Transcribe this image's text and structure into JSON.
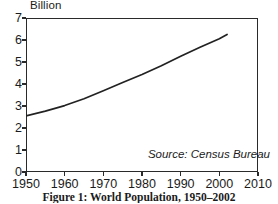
{
  "figure": {
    "caption": "Figure 1: World Population, 1950–2002",
    "source_note": "Source: Census Bureau",
    "unit_label": "Billion"
  },
  "chart_data": {
    "type": "line",
    "title": "World Population, 1950–2002",
    "xlabel": "",
    "ylabel": "Billion",
    "xlim": [
      1950,
      2010
    ],
    "ylim": [
      0,
      7
    ],
    "grid": false,
    "legend": "none",
    "line_color": "#222222",
    "xticks": [
      1950,
      1960,
      1970,
      1980,
      1990,
      2000,
      2010
    ],
    "xtick_labels": [
      "1950",
      "1960",
      "1970",
      "1980",
      "1990",
      "2000",
      "2010"
    ],
    "yticks": [
      0,
      1,
      2,
      3,
      4,
      5,
      6,
      7
    ],
    "ytick_labels": [
      "0",
      "1",
      "2",
      "3",
      "4",
      "5",
      "6",
      "7"
    ],
    "series": [
      {
        "name": "World Population",
        "units": "billion",
        "x": [
          1950,
          1955,
          1960,
          1965,
          1970,
          1975,
          1980,
          1985,
          1990,
          1995,
          2000,
          2002
        ],
        "values": [
          2.55,
          2.77,
          3.02,
          3.33,
          3.69,
          4.07,
          4.43,
          4.83,
          5.26,
          5.67,
          6.06,
          6.25
        ]
      }
    ],
    "annotations": [
      {
        "text": "Source: Census Bureau",
        "x": 2000,
        "y": 0.75,
        "style": "italic"
      }
    ]
  }
}
